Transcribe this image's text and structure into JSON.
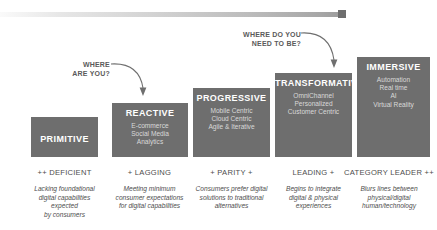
{
  "diagram": {
    "top_rule": {
      "accent_color": "#6e6e6e",
      "gradient_from": "#fafafa",
      "gradient_to": "#9a9a9a"
    },
    "box_color": "#6e6e6e",
    "title_color": "#ffffff",
    "subtitle_color": "#d9d9d9",
    "caption_color": "#4d4d4d",
    "stages": [
      {
        "id": "primitive",
        "title": "PRIMITIVE",
        "subtitle_lines": [],
        "caption_head": "++ DEFICIENT",
        "caption_lines": [
          "Lacking foundational",
          "digital capabilities",
          "expected",
          "by consumers"
        ]
      },
      {
        "id": "reactive",
        "title": "REACTIVE",
        "subtitle_lines": [
          "E-commerce",
          "Social Media",
          "Analytics"
        ],
        "caption_head": "+ LAGGING",
        "caption_lines": [
          "Meeting minimum",
          "consumer expectations",
          "for digital capabilities"
        ]
      },
      {
        "id": "progressive",
        "title": "PROGRESSIVE",
        "subtitle_lines": [
          "Mobile Centric",
          "Cloud Centric",
          "Agile & Iterative"
        ],
        "caption_head": "+ PARITY +",
        "caption_lines": [
          "Consumers prefer digital",
          "solutions to traditional",
          "alternatives"
        ]
      },
      {
        "id": "transformative",
        "title": "TRANSFORMATIVE",
        "subtitle_lines": [
          "OmniChannel",
          "Personalized",
          "Customer Centric"
        ],
        "caption_head": "LEADING +",
        "caption_lines": [
          "Begins to integrate",
          "digital & physical",
          "experiences"
        ]
      },
      {
        "id": "immersive",
        "title": "IMMERSIVE",
        "subtitle_lines": [
          "Automation",
          "Real time",
          "AI",
          "Virtual Reality"
        ],
        "caption_head": "CATEGORY LEADER ++",
        "caption_lines": [
          "Blurs lines between",
          "physical/digital",
          "human/technology"
        ]
      }
    ],
    "callouts": [
      {
        "id": "where-are-you",
        "lines": [
          "WHERE",
          "ARE YOU?"
        ],
        "points_to": "reactive"
      },
      {
        "id": "where-do-you-need-to-be",
        "lines": [
          "WHERE DO YOU",
          "NEED TO BE?"
        ],
        "points_to": "transformative"
      }
    ]
  }
}
